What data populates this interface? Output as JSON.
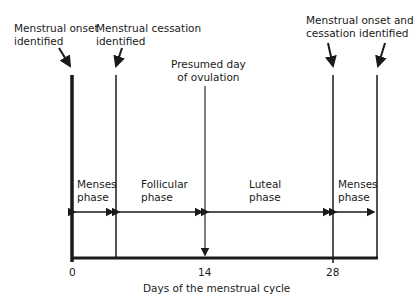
{
  "annotations": {
    "onset": [
      "Menstrual onset",
      "identified"
    ],
    "cessation": [
      "Menstrual cessation",
      "identified"
    ],
    "ovulation": [
      "Presumed day",
      "of ovulation"
    ],
    "onset_cessation": [
      "Menstrual onset and",
      "cessation identified"
    ]
  },
  "phases": [
    {
      "line1": "Menses",
      "line2": "phase"
    },
    {
      "line1": "Follicular",
      "line2": "phase"
    },
    {
      "line1": "Luteal",
      "line2": "phase"
    },
    {
      "line1": "Menses",
      "line2": "phase"
    }
  ],
  "axis": {
    "ticks": [
      "0",
      "14",
      "28"
    ],
    "label": "Days of the menstrual cycle"
  },
  "colors": {
    "line": "#1a1a1a",
    "ovulation_line": "#555555"
  }
}
